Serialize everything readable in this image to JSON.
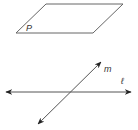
{
  "diagram": {
    "plane": {
      "label": "P",
      "points": "46,4 123,4 93,33 16,33",
      "label_pos": [
        26,
        31
      ]
    },
    "line_l": {
      "label": "ℓ",
      "x1": 6,
      "y1": 92,
      "x2": 131,
      "y2": 92,
      "label_pos": [
        121,
        84
      ]
    },
    "line_m": {
      "label": "m",
      "x1": 101,
      "y1": 62,
      "x2": 38,
      "y2": 124,
      "label_pos": [
        104,
        72
      ]
    },
    "colors": {
      "stroke": "#555555",
      "arrow": "#222222"
    }
  }
}
